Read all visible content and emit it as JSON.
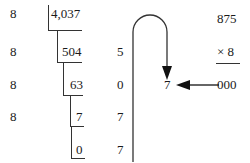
{
  "division": {
    "divisor_column": [
      "8",
      "8",
      "8",
      "8"
    ],
    "quotients": [
      "4,037",
      "504",
      "63",
      "7",
      "0"
    ],
    "remainders": [
      "5",
      "0",
      "7",
      "7"
    ]
  },
  "result": {
    "digit": "7",
    "arrow_source": "000"
  },
  "multiplication": {
    "top": "875",
    "multiplier": "× 8",
    "product": "000"
  },
  "icons": {
    "loop_arrow": "loop-down-arrow",
    "left_arrow": "left-arrow"
  }
}
